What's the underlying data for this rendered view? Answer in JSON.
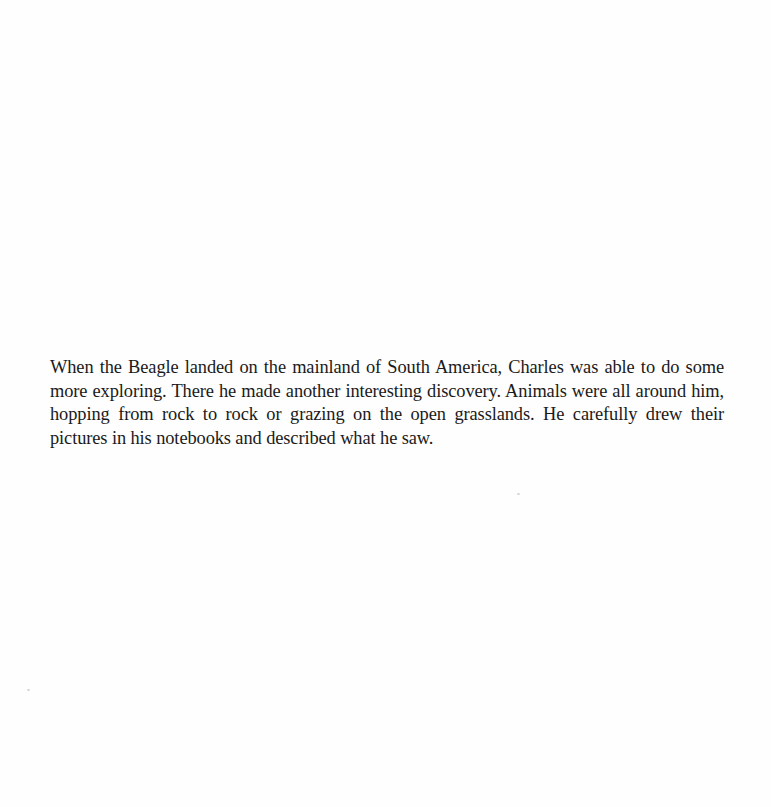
{
  "page": {
    "background_color": "#fefefe",
    "text_color": "#1a1a1a",
    "paragraph": "When the Beagle landed on the mainland of South America, Charles was able to do some more exploring. There he made another interesting discovery. Animals were all around him, hopping from rock to rock or grazing on the open grasslands. He carefully drew their pictures in his notebooks and described what he saw."
  }
}
